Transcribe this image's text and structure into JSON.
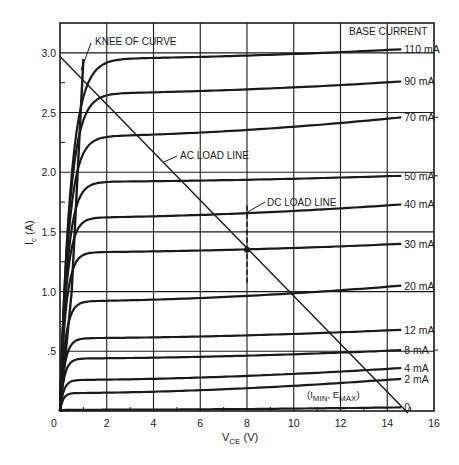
{
  "chart_data": {
    "type": "line",
    "title": "",
    "xlabel": "V_CE (V)",
    "ylabel": "I_c (A)",
    "xlim": [
      0,
      16
    ],
    "ylim": [
      0,
      3.25
    ],
    "grid": true,
    "x_ticks": [
      0,
      2,
      4,
      6,
      8,
      10,
      12,
      14,
      16
    ],
    "x_tick_labels": [
      "0",
      "2",
      "4",
      "6",
      "8",
      "10",
      "12",
      "14",
      "16"
    ],
    "y_ticks": [
      0.5,
      1.0,
      1.5,
      2.0,
      2.5,
      3.0
    ],
    "y_tick_labels": [
      ".5",
      "1.0",
      "1.5",
      "2.0",
      "2.5",
      "3.0"
    ],
    "legend_title": "BASE CURRENT",
    "series": [
      {
        "name": "110 mA",
        "knee_v": 1.0,
        "i_start": 2.95,
        "i_end": 3.03
      },
      {
        "name": "90 mA",
        "knee_v": 0.9,
        "i_start": 2.66,
        "i_end": 2.76
      },
      {
        "name": "70 mA",
        "knee_v": 0.8,
        "i_start": 2.3,
        "i_end": 2.46
      },
      {
        "name": "50 mA",
        "knee_v": 0.7,
        "i_start": 1.92,
        "i_end": 1.97
      },
      {
        "name": "40 mA",
        "knee_v": 0.6,
        "i_start": 1.62,
        "i_end": 1.73
      },
      {
        "name": "30 mA",
        "knee_v": 0.55,
        "i_start": 1.33,
        "i_end": 1.4
      },
      {
        "name": "20 mA",
        "knee_v": 0.5,
        "i_start": 0.92,
        "i_end": 1.05
      },
      {
        "name": "12 mA",
        "knee_v": 0.45,
        "i_start": 0.61,
        "i_end": 0.68
      },
      {
        "name": "8 mA",
        "knee_v": 0.4,
        "i_start": 0.44,
        "i_end": 0.51
      },
      {
        "name": "4 mA",
        "knee_v": 0.35,
        "i_start": 0.26,
        "i_end": 0.36
      },
      {
        "name": "2 mA",
        "knee_v": 0.3,
        "i_start": 0.15,
        "i_end": 0.27
      },
      {
        "name": "0",
        "knee_v": 0.2,
        "i_start": 0.01,
        "i_end": 0.03
      }
    ],
    "saturation_line": [
      [
        0,
        0
      ],
      [
        0.5,
        1.0
      ],
      [
        1.0,
        2.95
      ]
    ],
    "ac_load_line": {
      "label": "AC LOAD LINE",
      "points": [
        [
          0,
          2.97
        ],
        [
          14.8,
          0
        ]
      ]
    },
    "dc_load_line": {
      "label": "DC LOAD LINE",
      "v": 8,
      "i_range": [
        1.05,
        1.72
      ]
    },
    "q_point": {
      "v": 8,
      "i": 1.35
    },
    "annotations": [
      {
        "text": "KNEE OF CURVE",
        "target": [
          1.0,
          2.8
        ]
      },
      {
        "text": "AC LOAD LINE",
        "target": [
          6.0,
          1.8
        ]
      },
      {
        "text": "DC LOAD LINE",
        "target": [
          8.0,
          1.55
        ]
      },
      {
        "text": "(I_MIN, E_MAX)",
        "target": [
          14.8,
          0
        ]
      }
    ]
  },
  "labels": {
    "knee": "KNEE OF CURVE",
    "ac_load": "AC LOAD LINE",
    "dc_load": "DC LOAD LINE",
    "base_current": "BASE CURRENT",
    "imin_emax_open": "(I",
    "imin_sub": "MIN",
    "imin_comma": ", E",
    "emax_sub": "MAX",
    "imin_close": ")",
    "xlabel_main": "V",
    "xlabel_sub": "CE",
    "xlabel_unit": " (V)",
    "ylabel_main": "I",
    "ylabel_sub": "c",
    "ylabel_unit": " (A)"
  }
}
